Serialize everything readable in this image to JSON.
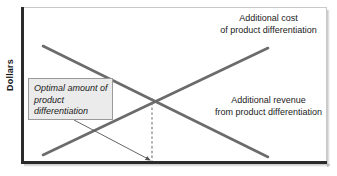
{
  "figure": {
    "y_axis_title": "Dollars",
    "labels": {
      "cost": "Additional cost\nof product differentiation",
      "revenue": "Additional revenue\nfrom product differentiation",
      "callout": "Optimal amount of product differentiation"
    },
    "colors": {
      "curve": "#6b6b6b",
      "axis": "#2b2b2b",
      "frame": "#c9c9c9",
      "callout_fill": "#ebebeb",
      "callout_border": "#9a9a9a",
      "text": "#1a1a1a",
      "dashed": "#7a7a7a"
    }
  },
  "chart_data": {
    "type": "line",
    "title": "",
    "xlabel": "",
    "ylabel": "Dollars",
    "xlim": [
      0,
      100
    ],
    "ylim": [
      0,
      100
    ],
    "grid": false,
    "legend": "inline-labels",
    "series": [
      {
        "name": "Additional cost of product differentiation",
        "label": "Additional cost\nof product differentiation",
        "slope": "increasing",
        "points": [
          [
            7,
            5
          ],
          [
            80,
            74
          ]
        ],
        "pixel_points": [
          [
            43,
            155
          ],
          [
            268,
            48
          ]
        ],
        "color": "#6b6b6b"
      },
      {
        "name": "Additional revenue from product differentiation",
        "label": "Additional revenue\nfrom product differentiation",
        "slope": "decreasing",
        "points": [
          [
            7,
            75
          ],
          [
            80,
            5
          ]
        ],
        "pixel_points": [
          [
            43,
            46
          ],
          [
            268,
            157
          ]
        ],
        "color": "#6b6b6b"
      }
    ],
    "annotations": [
      {
        "name": "intersection",
        "text": "Optimal amount of product differentiation",
        "point": [
          42,
          39
        ],
        "pixel_point": [
          152,
          98
        ],
        "dropline": "dashed vertical to x-axis"
      }
    ]
  }
}
